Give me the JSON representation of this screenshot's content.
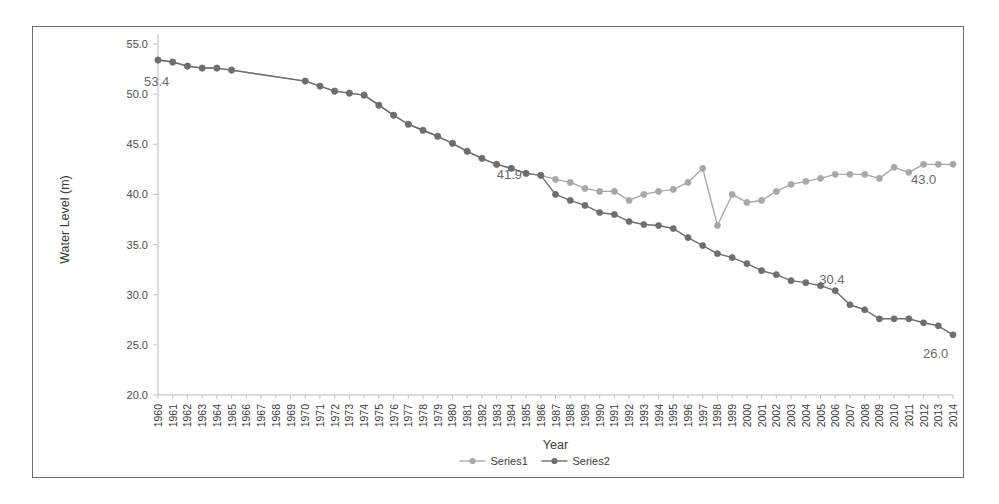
{
  "figure": {
    "background": "#ffffff",
    "frame_color": "#6f6f6f"
  },
  "chart_data": {
    "type": "line",
    "title": "",
    "xlabel": "Year",
    "ylabel": "Water Level (m)",
    "xlim": [
      1960,
      2014
    ],
    "ylim": [
      20.0,
      55.0
    ],
    "ytick_labels": [
      "55.0",
      "50.0",
      "45.0",
      "40.0",
      "35.0",
      "30.0",
      "25.0",
      "20.0"
    ],
    "ytick_values": [
      55.0,
      50.0,
      45.0,
      40.0,
      35.0,
      30.0,
      25.0,
      20.0
    ],
    "grid": false,
    "legend_position": "bottom",
    "x": [
      1960,
      1961,
      1962,
      1963,
      1964,
      1965,
      1966,
      1967,
      1968,
      1969,
      1970,
      1971,
      1972,
      1973,
      1974,
      1975,
      1976,
      1977,
      1978,
      1979,
      1980,
      1981,
      1982,
      1983,
      1984,
      1985,
      1986,
      1987,
      1988,
      1989,
      1990,
      1991,
      1992,
      1993,
      1994,
      1995,
      1996,
      1997,
      1998,
      1999,
      2000,
      2001,
      2002,
      2003,
      2004,
      2005,
      2006,
      2007,
      2008,
      2009,
      2010,
      2011,
      2012,
      2013,
      2014
    ],
    "categories": [
      "1960",
      "1961",
      "1962",
      "1963",
      "1964",
      "1965",
      "1966",
      "1967",
      "1968",
      "1969",
      "1970",
      "1971",
      "1972",
      "1973",
      "1974",
      "1975",
      "1976",
      "1977",
      "1978",
      "1979",
      "1980",
      "1981",
      "1982",
      "1983",
      "1984",
      "1985",
      "1986",
      "1987",
      "1988",
      "1989",
      "1990",
      "1991",
      "1992",
      "1993",
      "1994",
      "1995",
      "1996",
      "1997",
      "1998",
      "1999",
      "2000",
      "2001",
      "2002",
      "2003",
      "2004",
      "2005",
      "2006",
      "2007",
      "2008",
      "2009",
      "2010",
      "2011",
      "2012",
      "2013",
      "2014"
    ],
    "series": [
      {
        "name": "Series1",
        "color": "#a8a8a8",
        "values": [
          53.4,
          53.2,
          52.8,
          52.6,
          52.6,
          52.4,
          null,
          null,
          null,
          null,
          51.3,
          50.8,
          50.3,
          50.1,
          49.9,
          48.9,
          47.9,
          47.0,
          46.4,
          45.8,
          45.1,
          44.3,
          43.6,
          43.0,
          42.6,
          42.1,
          41.9,
          41.5,
          41.2,
          40.6,
          40.3,
          40.3,
          39.4,
          40.0,
          40.3,
          40.5,
          41.2,
          42.6,
          36.9,
          40.0,
          39.2,
          39.4,
          40.3,
          41.0,
          41.3,
          41.6,
          42.0,
          42.0,
          42.0,
          41.6,
          42.7,
          42.2,
          43.0,
          43.0,
          43.0
        ]
      },
      {
        "name": "Series2",
        "color": "#6e6e6e",
        "values": [
          53.4,
          53.2,
          52.8,
          52.6,
          52.6,
          52.4,
          null,
          null,
          null,
          null,
          51.3,
          50.8,
          50.3,
          50.1,
          49.9,
          48.9,
          47.9,
          47.0,
          46.4,
          45.8,
          45.1,
          44.3,
          43.6,
          43.0,
          42.6,
          42.1,
          41.9,
          40.0,
          39.4,
          38.9,
          38.2,
          38.0,
          37.3,
          37.0,
          36.9,
          36.6,
          35.7,
          34.9,
          34.1,
          33.7,
          33.1,
          32.4,
          32.0,
          31.4,
          31.2,
          30.9,
          30.4,
          29.0,
          28.5,
          27.6,
          27.6,
          27.6,
          27.2,
          26.9,
          26.0
        ]
      }
    ],
    "annotations": [
      {
        "text": "53.4",
        "year": 1960,
        "value": 53.4,
        "series": "Series1"
      },
      {
        "text": "41.9",
        "year": 1986,
        "value": 41.9,
        "series": "Series1"
      },
      {
        "text": "43.0",
        "year": 2014,
        "value": 43.0,
        "series": "Series1"
      },
      {
        "text": "30.4",
        "year": 2006,
        "value": 30.4,
        "series": "Series2"
      },
      {
        "text": "26.0",
        "year": 2014,
        "value": 26.0,
        "series": "Series2"
      }
    ]
  },
  "legend": {
    "items": [
      {
        "label": "Series1",
        "color": "#a8a8a8"
      },
      {
        "label": "Series2",
        "color": "#6e6e6e"
      }
    ]
  }
}
